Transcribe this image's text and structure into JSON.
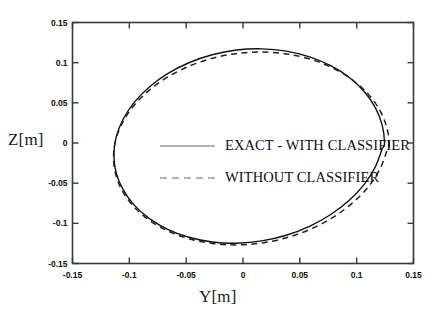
{
  "chart_data": {
    "type": "line",
    "title": "",
    "subtitle": "",
    "xlabel": "Y[m]",
    "ylabel": "Z[m]",
    "xlim": [
      -0.15,
      0.15
    ],
    "ylim": [
      -0.15,
      0.15
    ],
    "xticks": [
      "-0.15",
      "-0.1",
      "-0.05",
      "0",
      "0.05",
      "0.1",
      "0.15"
    ],
    "xtick_values": [
      -0.15,
      -0.1,
      -0.05,
      0,
      0.05,
      0.1,
      0.15
    ],
    "yticks": [
      "0.15",
      "0.1",
      "0.05",
      "0",
      "-0.05",
      "-0.1",
      "-0.15"
    ],
    "ytick_values": [
      0.15,
      0.1,
      0.05,
      0,
      -0.05,
      -0.1,
      -0.15
    ],
    "grid": false,
    "legend_position": "center",
    "aspect": "equal",
    "frame": "box",
    "tick_direction": "in",
    "series": [
      {
        "name": "EXACT - WITH CLASSIFIER",
        "style": "solid",
        "color": "#101010",
        "closed_curve": true,
        "shape": "ellipse",
        "center": [
          -0.001,
          -0.0005
        ],
        "semi_axis_y": 0.1255,
        "semi_axis_z": 0.1245,
        "points_y": [
          0.1245,
          0.1225,
          0.1165,
          0.1068,
          0.0935,
          0.0772,
          0.0585,
          0.038,
          0.0164,
          -0.0055,
          -0.0271,
          -0.0476,
          -0.0663,
          -0.0826,
          -0.0959,
          -0.1056,
          -0.1116,
          -0.1136,
          -0.1116,
          -0.1056,
          -0.0959,
          -0.0826,
          -0.0663,
          -0.0476,
          -0.0271,
          -0.0055,
          0.0164,
          0.038,
          0.0585,
          0.0772,
          0.0935,
          0.1068,
          0.1165,
          0.1225,
          0.1245
        ],
        "points_z": [
          -0.0005,
          0.022,
          0.0437,
          0.0638,
          0.0815,
          0.0962,
          0.1073,
          0.1144,
          0.1172,
          0.1157,
          0.1098,
          0.0999,
          0.0863,
          0.0695,
          0.0503,
          0.0293,
          0.0074,
          -0.0147,
          -0.0368,
          -0.0578,
          -0.077,
          -0.0938,
          -0.1074,
          -0.1173,
          -0.1232,
          -0.1247,
          -0.1219,
          -0.1148,
          -0.1037,
          -0.089,
          -0.0713,
          -0.0512,
          -0.0295,
          -0.007,
          -0.0005
        ]
      },
      {
        "name": "WITHOUT CLASSIFIER",
        "style": "dashed",
        "color": "#202020",
        "closed_curve": true,
        "shape": "ellipse",
        "center": [
          0.0025,
          -0.0035
        ],
        "semi_axis_y": 0.1262,
        "semi_axis_z": 0.1236,
        "points_y": [
          0.1287,
          0.1266,
          0.1205,
          0.1106,
          0.097,
          0.0804,
          0.0613,
          0.0405,
          0.0185,
          -0.0038,
          -0.0258,
          -0.0466,
          -0.0657,
          -0.0823,
          -0.0959,
          -0.1058,
          -0.1119,
          -0.1139,
          -0.1119,
          -0.1058,
          -0.0959,
          -0.0823,
          -0.0657,
          -0.0466,
          -0.0258,
          -0.0038,
          0.0185,
          0.0405,
          0.0613,
          0.0804,
          0.097,
          0.1106,
          0.1205,
          0.1266,
          0.1287
        ],
        "points_z": [
          -0.0035,
          0.0188,
          0.0403,
          0.0602,
          0.0778,
          0.0924,
          0.1034,
          0.1104,
          0.1132,
          0.1117,
          0.1059,
          0.0961,
          0.0826,
          0.0659,
          0.0468,
          0.026,
          0.0042,
          -0.0177,
          -0.0396,
          -0.0604,
          -0.0795,
          -0.0962,
          -0.1097,
          -0.1195,
          -0.1253,
          -0.1268,
          -0.1241,
          -0.117,
          -0.106,
          -0.0914,
          -0.0738,
          -0.0539,
          -0.0324,
          -0.0101,
          -0.0035
        ]
      }
    ]
  },
  "legend": {
    "items": [
      {
        "label": "EXACT - WITH CLASSIFIER",
        "style": "solid"
      },
      {
        "label": "WITHOUT CLASSIFIER",
        "style": "dashed"
      }
    ]
  },
  "axes": {
    "x_title": "Y[m]",
    "y_title": "Z[m]"
  }
}
